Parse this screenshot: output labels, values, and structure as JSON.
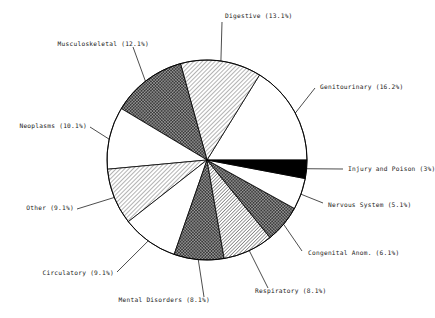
{
  "chart_data": {
    "type": "pie",
    "title": "",
    "subtitle": "",
    "xlabel": "",
    "ylabel": "",
    "legend_position": "callout-labels",
    "grid": false,
    "start_angle_deg": 0,
    "direction": "counterclockwise",
    "units": "percent",
    "categories": [
      "Genitourinary",
      "Digestive",
      "Musculoskeletal",
      "Neoplasms",
      "Other",
      "Circulatory",
      "Mental Disorders",
      "Respiratory",
      "Congenital Anom.",
      "Nervous System",
      "Injury and Poison"
    ],
    "values": [
      16.2,
      13.1,
      12.1,
      10.1,
      9.1,
      9.1,
      8.1,
      8.1,
      6.1,
      5.1,
      3.0
    ],
    "total": 100.1,
    "slices": [
      {
        "label": "Genitourinary",
        "value": 16.2,
        "label_text": "Genitourinary (16.2%)",
        "fill": "white",
        "start_deg": 0.0,
        "end_deg": 58.3
      },
      {
        "label": "Digestive",
        "value": 13.1,
        "label_text": "Digestive (13.1%)",
        "fill": "lighthatch",
        "start_deg": 58.3,
        "end_deg": 105.4
      },
      {
        "label": "Musculoskeletal",
        "value": 12.1,
        "label_text": "Musculoskeletal (12.1%)",
        "fill": "darkhatch",
        "start_deg": 105.4,
        "end_deg": 149.0
      },
      {
        "label": "Neoplasms",
        "value": 10.1,
        "label_text": "Neoplasms (10.1%)",
        "fill": "white",
        "start_deg": 149.0,
        "end_deg": 185.3
      },
      {
        "label": "Other",
        "value": 9.1,
        "label_text": "Other (9.1%)",
        "fill": "lighthatch",
        "start_deg": 185.3,
        "end_deg": 218.1
      },
      {
        "label": "Circulatory",
        "value": 9.1,
        "label_text": "Circulatory (9.1%)",
        "fill": "white",
        "start_deg": 218.1,
        "end_deg": 250.8
      },
      {
        "label": "Mental Disorders",
        "value": 8.1,
        "label_text": "Mental Disorders (8.1%)",
        "fill": "darkhatch",
        "start_deg": 250.8,
        "end_deg": 279.9
      },
      {
        "label": "Respiratory",
        "value": 8.1,
        "label_text": "Respiratory (8.1%)",
        "fill": "greyhatch",
        "start_deg": 279.9,
        "end_deg": 309.1
      },
      {
        "label": "Congenital Anom.",
        "value": 6.1,
        "label_text": "Congenital Anom. (6.1%)",
        "fill": "darkhatch",
        "start_deg": 309.1,
        "end_deg": 331.0
      },
      {
        "label": "Nervous System",
        "value": 5.1,
        "label_text": "Nervous System (5.1%)",
        "fill": "white",
        "start_deg": 331.0,
        "end_deg": 349.3
      },
      {
        "label": "Injury and Poison",
        "value": 3.0,
        "label_text": "Injury and Poison (3%)",
        "fill": "black",
        "start_deg": 349.3,
        "end_deg": 360.0
      }
    ]
  },
  "labels": {
    "digestive": "Digestive (13.1%)",
    "musculoskeletal": "Musculoskeletal (12.1%)",
    "neoplasms": "Neoplasms (10.1%)",
    "other": "Other (9.1%)",
    "circulatory": "Circulatory (9.1%)",
    "mental_disorders": "Mental Disorders (8.1%)",
    "respiratory": "Respiratory (8.1%)",
    "congenital": "Congenital Anom. (6.1%)",
    "nervous_system": "Nervous System (5.1%)",
    "injury_poison": "Injury and Poison (3%)",
    "genitourinary": "Genitourinary (16.2%)"
  },
  "colors": {
    "outline": "#000000",
    "background": "#ffffff",
    "text": "#1a1a1a",
    "black_slice": "#000000",
    "light_hatch": "#d8d8d8",
    "grey_hatch": "#c0c0c0",
    "dark_hatch": "#4a4a4a"
  }
}
